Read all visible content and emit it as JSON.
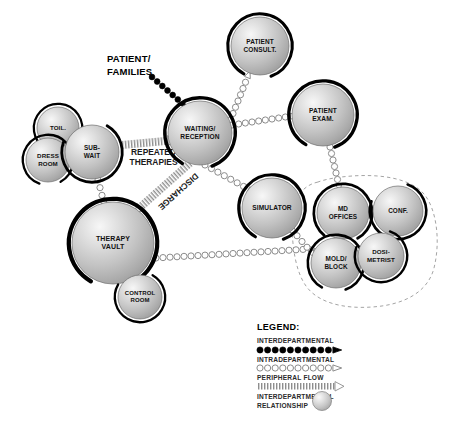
{
  "diagram": {
    "background_color": "#ffffff",
    "bubble_fill_light": "#f2f2f2",
    "bubble_fill_mid": "#c9c9c9",
    "bubble_fill_dark": "#9a9a9a",
    "outline_color": "#000000",
    "chain_color": "#8c8c8c"
  },
  "annotations": {
    "patient_families": "PATIENT/\nFAMILIES",
    "patient_families_line1": "PATIENT/",
    "patient_families_line2": "FAMILIES",
    "repeated_therapies_line1": "REPEATED",
    "repeated_therapies_line2": "THERAPIES",
    "discharge": "DISCHARGE"
  },
  "bubbles": [
    {
      "id": "toil",
      "label_lines": [
        "TOIL."
      ],
      "cx": 58,
      "cy": 128,
      "r": 21,
      "font_size": 6.2,
      "arc_start": 120,
      "arc_end": 430
    },
    {
      "id": "dress-room",
      "label_lines": [
        "DRESS",
        "ROOM"
      ],
      "cx": 48,
      "cy": 160,
      "r": 22,
      "font_size": 6.2,
      "arc_start": 110,
      "arc_end": 420
    },
    {
      "id": "sub-wait",
      "label_lines": [
        "SUB-",
        "WAIT"
      ],
      "cx": 92,
      "cy": 152,
      "r": 27,
      "font_size": 6.4,
      "arc_start": 300,
      "arc_end": 560
    },
    {
      "id": "waiting-reception",
      "label_lines": [
        "WAITING/",
        "RECEPTION"
      ],
      "cx": 200,
      "cy": 133,
      "r": 32,
      "font_size": 6.6,
      "arc_start": 120,
      "arc_end": 430
    },
    {
      "id": "patient-consult",
      "label_lines": [
        "PATIENT",
        "CONSULT."
      ],
      "cx": 260,
      "cy": 46,
      "r": 29,
      "font_size": 6.5,
      "arc_start": 120,
      "arc_end": 430
    },
    {
      "id": "patient-exam",
      "label_lines": [
        "PATIENT",
        "EXAM."
      ],
      "cx": 323,
      "cy": 115,
      "r": 31,
      "font_size": 6.6,
      "arc_start": 120,
      "arc_end": 430
    },
    {
      "id": "simulator",
      "label_lines": [
        "SIMULATOR"
      ],
      "cx": 272,
      "cy": 208,
      "r": 30,
      "font_size": 6.6,
      "arc_start": 120,
      "arc_end": 430
    },
    {
      "id": "therapy-vault",
      "label_lines": [
        "THERAPY",
        "VAULT"
      ],
      "cx": 113,
      "cy": 243,
      "r": 41,
      "font_size": 7.0,
      "arc_start": 120,
      "arc_end": 430
    },
    {
      "id": "control-room",
      "label_lines": [
        "CONTROL",
        "ROOM"
      ],
      "cx": 140,
      "cy": 297,
      "r": 22,
      "font_size": 6.0,
      "arc_start": 300,
      "arc_end": 570
    },
    {
      "id": "md-offices",
      "label_lines": [
        "MD",
        "OFFICES"
      ],
      "cx": 343,
      "cy": 213,
      "r": 26,
      "font_size": 6.4,
      "arc_start": 130,
      "arc_end": 420
    },
    {
      "id": "conf",
      "label_lines": [
        "CONF."
      ],
      "cx": 398,
      "cy": 211,
      "r": 25,
      "font_size": 6.4,
      "arc_start": 290,
      "arc_end": 560
    },
    {
      "id": "mold-block",
      "label_lines": [
        "MOLD/",
        "BLOCK"
      ],
      "cx": 336,
      "cy": 263,
      "r": 25,
      "font_size": 6.4,
      "arc_start": 120,
      "arc_end": 430
    },
    {
      "id": "dosimetrist",
      "label_lines": [
        "DOSI-",
        "METRIST"
      ],
      "cx": 381,
      "cy": 256,
      "r": 23,
      "font_size": 6.2,
      "arc_start": 290,
      "arc_end": 560
    }
  ],
  "connections": [
    {
      "id": "patient-to-waiting",
      "type": "interdepartmental",
      "from": [
        152,
        77
      ],
      "to": [
        183,
        104
      ]
    },
    {
      "id": "subwait-to-therapy",
      "type": "intradepartmental",
      "from": [
        98,
        180
      ],
      "to": [
        104,
        203
      ]
    },
    {
      "id": "waiting-to-consult",
      "type": "intradepartmental",
      "from": [
        228,
        126
      ],
      "to": [
        248,
        76
      ]
    },
    {
      "id": "waiting-to-exam",
      "type": "intradepartmental",
      "from": [
        232,
        125
      ],
      "to": [
        292,
        116
      ]
    },
    {
      "id": "waiting-to-simulator",
      "type": "intradepartmental",
      "from": [
        205,
        165
      ],
      "to": [
        250,
        190
      ]
    },
    {
      "id": "exam-to-mdoffices",
      "type": "intradepartmental",
      "from": [
        330,
        147
      ],
      "to": [
        339,
        186
      ]
    },
    {
      "id": "therapy-to-right",
      "type": "intradepartmental",
      "from": [
        156,
        258
      ],
      "to": [
        310,
        249
      ]
    },
    {
      "id": "simulator-to-moldblock",
      "type": "intradepartmental",
      "from": [
        292,
        230
      ],
      "to": [
        312,
        253
      ]
    }
  ],
  "peripheral_flows": [
    {
      "id": "repeated-therapies",
      "label_line1": "REPEATED",
      "label_line2": "THERAPIES",
      "from": [
        122,
        145
      ],
      "to": [
        175,
        140
      ]
    },
    {
      "id": "discharge",
      "label": "DISCHARGE",
      "from": [
        190,
        163
      ],
      "to": [
        135,
        212
      ]
    }
  ],
  "enclosure": {
    "id": "physician-support-zone",
    "style": "dashed"
  },
  "legend": {
    "title": "LEGEND:",
    "items": [
      {
        "id": "interdepartmental",
        "label": "INTERDEPARTMENTAL",
        "symbol": "filled-dot-chain"
      },
      {
        "id": "intradepartmental",
        "label": "INTRADEPARTMENTAL",
        "symbol": "open-circle-chain"
      },
      {
        "id": "peripheral-flow",
        "label": "PERIPHERAL FLOW",
        "symbol": "hatched-band-arrow"
      },
      {
        "id": "interdepartmental-relationship",
        "label_line1": "INTERDEPARTMENTAL",
        "label_line2": "RELATIONSHIP",
        "symbol": "gradient-sphere"
      }
    ]
  }
}
